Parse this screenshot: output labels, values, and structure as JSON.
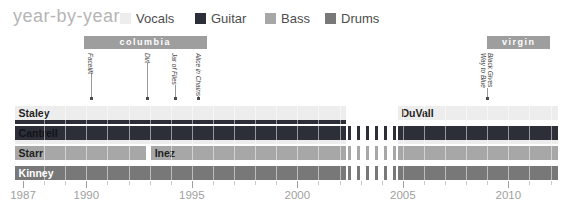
{
  "chart_data": {
    "type": "bar",
    "subtype": "band-membership-gantt-timeline",
    "title": "year-by-year",
    "legend_position": "top",
    "grid": true,
    "legend": [
      {
        "label": "Vocals",
        "role": "vocals",
        "color": "#ededed"
      },
      {
        "label": "Guitar",
        "role": "guitar",
        "color": "#2c2f37"
      },
      {
        "label": "Bass",
        "role": "bass",
        "color": "#a7a7a7"
      },
      {
        "label": "Drums",
        "role": "drums",
        "color": "#787878"
      }
    ],
    "axis": {
      "start_year": 1987,
      "end_year": 2012,
      "tick_interval": 1,
      "labeled_ticks": [
        1987,
        1990,
        1995,
        2000,
        2005,
        2010
      ],
      "text_color": "#9f9f9f"
    },
    "record_labels": [
      {
        "name": "columbia",
        "start": 1989.9,
        "end": 1995.7,
        "color": "#9e9e9e"
      },
      {
        "name": "virgin",
        "start": 2009.0,
        "end": 2012.0,
        "color": "#9e9e9e"
      }
    ],
    "albums": [
      {
        "title": "Facelift",
        "year": 1990.2
      },
      {
        "title": "Dirt",
        "year": 1992.9
      },
      {
        "title": "Jar of Flies",
        "year": 1994.2
      },
      {
        "title": "Alice in Chains",
        "year": 1995.3
      },
      {
        "title": "Black Gives\nWay to Blue",
        "year": 2009.0
      }
    ],
    "hiatus": {
      "start": 2002.4,
      "end": 2004.7
    },
    "rows": [
      {
        "instrument": "Vocals",
        "hiatus_dashes": false,
        "segments": [
          {
            "member": "Staley",
            "role": "vocals",
            "start": 1986.6,
            "end": 2002.3,
            "sub_role": "guitar",
            "text": "#1f1f1f"
          },
          {
            "member": "DuVall",
            "role": "vocals",
            "start": 2004.75,
            "end": 2012.35,
            "text": "#1f1f1f"
          }
        ]
      },
      {
        "instrument": "Guitar",
        "hiatus_dashes": true,
        "segments": [
          {
            "member": "Cantrell",
            "role": "guitar",
            "start": 1986.6,
            "end": 2002.3,
            "sub_role": "vocals",
            "text": "#10131a"
          },
          {
            "member": "",
            "role": "guitar",
            "start": 2004.75,
            "end": 2012.35,
            "sub_role": "vocals"
          }
        ]
      },
      {
        "instrument": "Bass",
        "hiatus_dashes": true,
        "segments": [
          {
            "member": "Starr",
            "role": "bass",
            "start": 1986.6,
            "end": 1992.85,
            "text": "#1f1f1f"
          },
          {
            "member": "Inez",
            "role": "bass",
            "start": 1993.05,
            "end": 2002.3,
            "text": "#1f1f1f"
          },
          {
            "member": "",
            "role": "bass",
            "start": 2004.75,
            "end": 2012.35
          }
        ]
      },
      {
        "instrument": "Drums",
        "hiatus_dashes": true,
        "segments": [
          {
            "member": "Kinney",
            "role": "drums",
            "start": 1986.6,
            "end": 2002.3,
            "text": "#ffffff"
          },
          {
            "member": "",
            "role": "drums",
            "start": 2004.75,
            "end": 2012.35
          }
        ]
      }
    ],
    "marker_style": {
      "line_color": "#9a9a9a",
      "dot_color": "#4a4a4a"
    }
  }
}
